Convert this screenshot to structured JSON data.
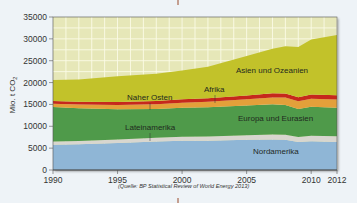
{
  "chart_data": {
    "type": "area",
    "stacked": true,
    "title": "",
    "xlabel": "",
    "ylabel": "Mio. t CO2",
    "ylim": [
      0,
      35000
    ],
    "xlim": [
      1990,
      2012
    ],
    "x_ticks": [
      1990,
      1995,
      2000,
      2005,
      2010,
      2012
    ],
    "y_ticks": [
      0,
      5000,
      10000,
      15000,
      20000,
      25000,
      30000,
      35000
    ],
    "y_tick_labels": [
      "0",
      "5000",
      "10000",
      "15000",
      "20000",
      "25000",
      "30000",
      "35000"
    ],
    "grid": true,
    "source_note": "(Quelle: BP Statistical Review of World Energy 2013)",
    "x": [
      1990,
      1992,
      1995,
      1998,
      2000,
      2002,
      2005,
      2007,
      2008,
      2009,
      2010,
      2012
    ],
    "series": [
      {
        "name": "Nordamerika",
        "color": "#8fb6d6",
        "values": [
          5800,
          5900,
          6200,
          6500,
          6700,
          6700,
          6900,
          7000,
          6900,
          6400,
          6600,
          6400
        ]
      },
      {
        "name": "Lateinamerika",
        "color": "#d8d6cf",
        "values": [
          700,
          740,
          800,
          880,
          930,
          960,
          1060,
          1140,
          1190,
          1170,
          1250,
          1330
        ]
      },
      {
        "name": "Europa und Eurasien",
        "color": "#4f9a4a",
        "values": [
          7900,
          7500,
          6900,
          6600,
          6600,
          6700,
          6800,
          6900,
          6800,
          6400,
          6600,
          6500
        ]
      },
      {
        "name": "Naher Osten",
        "color": "#e3a03a",
        "values": [
          750,
          820,
          950,
          1070,
          1150,
          1250,
          1430,
          1570,
          1680,
          1740,
          1830,
          1880
        ]
      },
      {
        "name": "Afrika",
        "color": "#c6281c",
        "values": [
          650,
          660,
          700,
          740,
          780,
          800,
          880,
          930,
          950,
          940,
          970,
          1000
        ]
      },
      {
        "name": "Asien und Ozeanien",
        "color": "#c2c22a",
        "values": [
          4800,
          5100,
          5900,
          6200,
          6600,
          7200,
          9000,
          10200,
          10800,
          11500,
          12600,
          13800
        ]
      }
    ],
    "area_labels": [
      {
        "series": "Asien und Ozeanien",
        "text": "Asien und Ozeanien"
      },
      {
        "series": "Afrika",
        "text": "Afrika"
      },
      {
        "series": "Naher Osten",
        "text": "Naher Osten"
      },
      {
        "series": "Europa und Eurasien",
        "text": "Europa und Eurasien"
      },
      {
        "series": "Lateinamerika",
        "text": "Lateinamerika"
      },
      {
        "series": "Nordamerika",
        "text": "Nordamerika"
      }
    ]
  },
  "labels": {
    "asien": "Asien und Ozeanien",
    "afrika": "Afrika",
    "naher_osten": "Naher Osten",
    "europa": "Europa und Eurasien",
    "lateinamerika": "Lateinamerika",
    "nordamerika": "Nordamerika",
    "ylabel": "Mio. t CO",
    "ylabel_sub": "2",
    "source": "(Quelle: BP Statistical Review of World Energy 2013)"
  },
  "y_ticks": [
    "35000",
    "30000",
    "25000",
    "20000",
    "15000",
    "10000",
    "5000",
    "0"
  ],
  "x_ticks": [
    "1990",
    "1995",
    "2000",
    "2005",
    "2010",
    "2012"
  ]
}
